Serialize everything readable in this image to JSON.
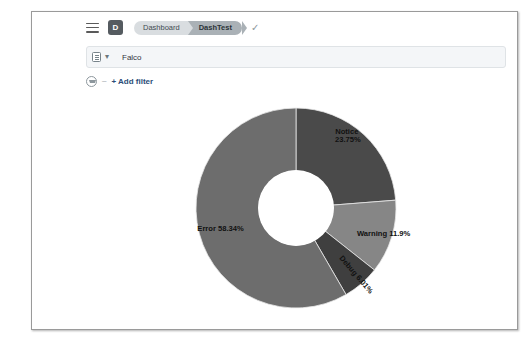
{
  "window": {
    "nav": {
      "menu_icon": "hamburger-menu-icon",
      "app_badge_label": "D",
      "breadcrumbs": [
        {
          "label": "Dashboard",
          "active": false
        },
        {
          "label": "DashTest",
          "active": true
        }
      ],
      "status_icon": "check-icon"
    },
    "query_bar": {
      "dataview_icon": "data-view-icon",
      "caret_icon": "chevron-down-icon",
      "value": "Falco",
      "placeholder": "Search"
    },
    "filter_bar": {
      "filter_icon": "filter-funnel-icon",
      "separator": "–",
      "add_filter_label": "+ Add filter"
    }
  },
  "colors": {
    "notice": "#4a4a4a",
    "error": "#6d6d6d",
    "warning": "#868686",
    "debug": "#3f3f3f",
    "label_text": "#111111",
    "panel_background": "#ffffff",
    "frame_border": "#9a9a9a",
    "crumb_inactive": "#d9dde0",
    "crumb_active": "#aab1b6",
    "link": "#2b4d78"
  },
  "chart_data": {
    "type": "pie",
    "variant": "donut",
    "title": "",
    "xlabel": "",
    "ylabel": "",
    "legend_position": "none",
    "grid": false,
    "labels_inside": true,
    "total_percent": 100.0,
    "start_angle_deg": 0,
    "direction": "clockwise",
    "inner_radius_ratio": 0.37,
    "categories": [
      "Notice",
      "Warning",
      "Debug",
      "Error"
    ],
    "values": [
      23.75,
      11.9,
      6.01,
      58.34
    ],
    "slices": [
      {
        "name": "Notice",
        "value": 23.75,
        "label": "Notice",
        "percent_text": "23.75%",
        "color": "#4a4a4a",
        "label_lines": [
          "Notice",
          "23.75%"
        ],
        "rotated": false
      },
      {
        "name": "Warning",
        "value": 11.9,
        "label": "Warning",
        "percent_text": "11.9%",
        "color": "#868686",
        "label_lines": [
          "Warning 11.9%"
        ],
        "rotated": false
      },
      {
        "name": "Debug",
        "value": 6.01,
        "label": "Debug",
        "percent_text": "6.01%",
        "color": "#3f3f3f",
        "label_lines": [
          "Debug 6.01%"
        ],
        "rotated": true
      },
      {
        "name": "Error",
        "value": 58.34,
        "label": "Error",
        "percent_text": "58.34%",
        "color": "#6d6d6d",
        "label_lines": [
          "Error 58.34%"
        ],
        "rotated": false
      }
    ]
  }
}
